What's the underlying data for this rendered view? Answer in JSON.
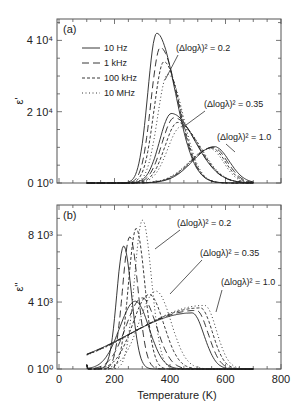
{
  "chart_data": [
    {
      "type": "line",
      "panel_label": "(a)",
      "ylabel": "ε'",
      "xlabel": "",
      "xlim": [
        0,
        800
      ],
      "ylim": [
        0,
        46000
      ],
      "ytick_values": [
        0,
        20000,
        40000
      ],
      "ytick_labels": [
        "0 10⁰",
        "2 10⁴",
        "4 10⁴"
      ],
      "legend": [
        "10 Hz",
        "1 kHz",
        "100 kHz",
        "10 MHz"
      ],
      "legend_position": "upper-left",
      "annotations": [
        "(Δlogλ)² = 0.2",
        "(Δlogλ)² = 0.35",
        "(Δlogλ)² = 1.0"
      ],
      "groups": [
        {
          "name": "(Δlogλ)² = 0.2",
          "series": [
            {
              "name": "10 Hz",
              "peak_T": 352,
              "peak": 42000,
              "width_lo": 45,
              "width_hi": 95
            },
            {
              "name": "1 kHz",
              "peak_T": 365,
              "peak": 38000,
              "width_lo": 47,
              "width_hi": 90
            },
            {
              "name": "100 kHz",
              "peak_T": 378,
              "peak": 34000,
              "width_lo": 50,
              "width_hi": 85
            },
            {
              "name": "10 MHz",
              "peak_T": 392,
              "peak": 30500,
              "width_lo": 52,
              "width_hi": 80
            }
          ]
        },
        {
          "name": "(Δlogλ)² = 0.35",
          "series": [
            {
              "name": "10 Hz",
              "peak_T": 405,
              "peak": 19500,
              "width_lo": 60,
              "width_hi": 120
            },
            {
              "name": "1 kHz",
              "peak_T": 415,
              "peak": 18300,
              "width_lo": 62,
              "width_hi": 115
            },
            {
              "name": "100 kHz",
              "peak_T": 428,
              "peak": 17000,
              "width_lo": 65,
              "width_hi": 110
            },
            {
              "name": "10 MHz",
              "peak_T": 440,
              "peak": 15800,
              "width_lo": 68,
              "width_hi": 105
            }
          ]
        },
        {
          "name": "(Δlogλ)² = 1.0",
          "series": [
            {
              "name": "10 Hz",
              "peak_T": 560,
              "peak": 10200,
              "width_lo": 110,
              "width_hi": 75
            },
            {
              "name": "1 kHz",
              "peak_T": 555,
              "peak": 10000,
              "width_lo": 110,
              "width_hi": 72
            },
            {
              "name": "100 kHz",
              "peak_T": 550,
              "peak": 9800,
              "width_lo": 110,
              "width_hi": 70
            },
            {
              "name": "10 MHz",
              "peak_T": 545,
              "peak": 9600,
              "width_lo": 110,
              "width_hi": 68
            }
          ]
        }
      ]
    },
    {
      "type": "line",
      "panel_label": "(b)",
      "ylabel": "ε''",
      "xlabel": "Temperature (K)",
      "xlim": [
        0,
        800
      ],
      "xtick_values": [
        0,
        200,
        400,
        600,
        800
      ],
      "xtick_labels": [
        "0",
        "200",
        "400",
        "600",
        "800"
      ],
      "ylim": [
        0,
        9800
      ],
      "ytick_values": [
        0,
        4000,
        8000
      ],
      "ytick_labels": [
        "0 10⁰",
        "4 10³",
        "8 10³"
      ],
      "annotations": [
        "(Δlogλ)² = 0.2",
        "(Δlogλ)² = 0.35",
        "(Δlogλ)² = 1.0"
      ],
      "groups": [
        {
          "name": "(Δlogλ)² = 0.2",
          "series": [
            {
              "name": "10 Hz",
              "peak_T": 233,
              "peak": 7350,
              "width_lo": 35,
              "width_hi": 40
            },
            {
              "name": "1 kHz",
              "peak_T": 255,
              "peak": 7900,
              "width_lo": 37,
              "width_hi": 42
            },
            {
              "name": "100 kHz",
              "peak_T": 278,
              "peak": 8400,
              "width_lo": 39,
              "width_hi": 44
            },
            {
              "name": "10 MHz",
              "peak_T": 301,
              "peak": 8900,
              "width_lo": 41,
              "width_hi": 46
            }
          ]
        },
        {
          "name": "(Δlogλ)² = 0.35",
          "series": [
            {
              "name": "10 Hz",
              "peak_T": 275,
              "peak": 4050,
              "width_lo": 80,
              "width_hi": 70
            },
            {
              "name": "1 kHz",
              "peak_T": 300,
              "peak": 4250,
              "width_lo": 82,
              "width_hi": 72
            },
            {
              "name": "100 kHz",
              "peak_T": 325,
              "peak": 4450,
              "width_lo": 84,
              "width_hi": 74
            },
            {
              "name": "10 MHz",
              "peak_T": 350,
              "peak": 4650,
              "width_lo": 86,
              "width_hi": 76
            }
          ]
        },
        {
          "name": "(Δlogλ)² = 1.0",
          "series": [
            {
              "name": "10 Hz",
              "peak_T": 480,
              "peak": 3350,
              "width_lo": 330,
              "width_hi": 60
            },
            {
              "name": "1 kHz",
              "peak_T": 495,
              "peak": 3500,
              "width_lo": 335,
              "width_hi": 60
            },
            {
              "name": "100 kHz",
              "peak_T": 510,
              "peak": 3650,
              "width_lo": 340,
              "width_hi": 60
            },
            {
              "name": "10 MHz",
              "peak_T": 525,
              "peak": 3800,
              "width_lo": 345,
              "width_hi": 60
            }
          ]
        }
      ]
    }
  ],
  "styles": {
    "10 Hz": "",
    "1 kHz": "7,4",
    "100 kHz": "3,2",
    "10 MHz": "1,2.5"
  },
  "layout": {
    "x_min_T": 100
  }
}
